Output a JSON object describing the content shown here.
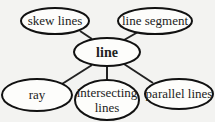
{
  "diagram": {
    "type": "concept-map",
    "center": {
      "label": "line"
    },
    "nodes": [
      {
        "label": "skew lines"
      },
      {
        "label": "line segment"
      },
      {
        "label": "ray"
      },
      {
        "label": "intersecting",
        "label2": "lines"
      },
      {
        "label": "parallel lines"
      }
    ]
  }
}
